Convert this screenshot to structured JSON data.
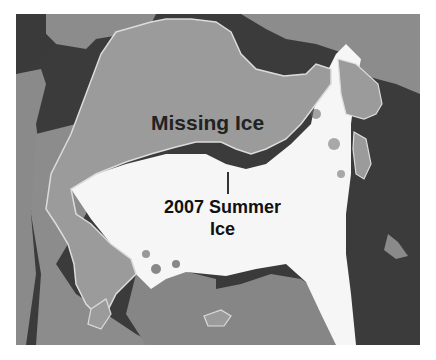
{
  "map": {
    "title": "Arctic sea ice extent comparison",
    "labels": {
      "missing_ice": "Missing Ice",
      "summer_ice_line1": "2007 Summer",
      "summer_ice_line2": "Ice"
    },
    "legend_colors": {
      "ocean": "#3a3a3a",
      "land": "#8a8a8a",
      "missing_ice": "#9a9a9a",
      "missing_ice_outline": "#d8d8d8",
      "summer_ice": "#ffffff"
    }
  }
}
